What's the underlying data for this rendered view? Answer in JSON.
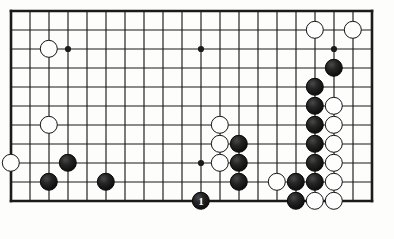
{
  "diagram": {
    "kind": "go-board-diagram",
    "title": "Go board position diagram",
    "board": {
      "columns": 20,
      "rows": 11,
      "origin_x": 11,
      "origin_y": 11,
      "cell": 19.0,
      "border_width": 2.6,
      "line_width": 1.15,
      "line_color": "#1b1b1b",
      "board_color": "#fdfdfb",
      "stone_radius": 9.2,
      "star_radius": 3.1,
      "star_points": [
        {
          "col": 3,
          "row": 2
        },
        {
          "col": 10,
          "row": 2
        },
        {
          "col": 17,
          "row": 2
        },
        {
          "col": 10,
          "row": 8
        }
      ]
    },
    "stones": [
      {
        "col": 16,
        "row": 1,
        "color": "white",
        "label": ""
      },
      {
        "col": 18,
        "row": 1,
        "color": "white",
        "label": ""
      },
      {
        "col": 2,
        "row": 2,
        "color": "white",
        "label": ""
      },
      {
        "col": 17,
        "row": 3,
        "color": "black",
        "label": ""
      },
      {
        "col": 16,
        "row": 4,
        "color": "black",
        "label": ""
      },
      {
        "col": 16,
        "row": 5,
        "color": "black",
        "label": ""
      },
      {
        "col": 17,
        "row": 5,
        "color": "white",
        "label": ""
      },
      {
        "col": 2,
        "row": 6,
        "color": "white",
        "label": ""
      },
      {
        "col": 11,
        "row": 6,
        "color": "white",
        "label": ""
      },
      {
        "col": 16,
        "row": 6,
        "color": "black",
        "label": ""
      },
      {
        "col": 17,
        "row": 6,
        "color": "white",
        "label": ""
      },
      {
        "col": 11,
        "row": 7,
        "color": "white",
        "label": ""
      },
      {
        "col": 12,
        "row": 7,
        "color": "black",
        "label": ""
      },
      {
        "col": 16,
        "row": 7,
        "color": "black",
        "label": ""
      },
      {
        "col": 17,
        "row": 7,
        "color": "white",
        "label": ""
      },
      {
        "col": 0,
        "row": 8,
        "color": "white",
        "label": ""
      },
      {
        "col": 3,
        "row": 8,
        "color": "black",
        "label": ""
      },
      {
        "col": 11,
        "row": 8,
        "color": "white",
        "label": ""
      },
      {
        "col": 12,
        "row": 8,
        "color": "black",
        "label": ""
      },
      {
        "col": 16,
        "row": 8,
        "color": "black",
        "label": ""
      },
      {
        "col": 17,
        "row": 8,
        "color": "white",
        "label": ""
      },
      {
        "col": 2,
        "row": 9,
        "color": "black",
        "label": ""
      },
      {
        "col": 5,
        "row": 9,
        "color": "black",
        "label": ""
      },
      {
        "col": 12,
        "row": 9,
        "color": "black",
        "label": ""
      },
      {
        "col": 14,
        "row": 9,
        "color": "white",
        "label": ""
      },
      {
        "col": 15,
        "row": 9,
        "color": "black",
        "label": ""
      },
      {
        "col": 16,
        "row": 9,
        "color": "black",
        "label": ""
      },
      {
        "col": 17,
        "row": 9,
        "color": "white",
        "label": ""
      },
      {
        "col": 10,
        "row": 10,
        "color": "black",
        "label": "1"
      },
      {
        "col": 15,
        "row": 10,
        "color": "black",
        "label": ""
      },
      {
        "col": 16,
        "row": 10,
        "color": "white",
        "label": ""
      },
      {
        "col": 17,
        "row": 10,
        "color": "white",
        "label": ""
      }
    ],
    "move_numbers": {
      "1": {
        "col": 10,
        "row": 10,
        "color": "black"
      }
    },
    "counts": {
      "black_stones": 17,
      "white_stones": 15,
      "total_stones": 32
    }
  }
}
